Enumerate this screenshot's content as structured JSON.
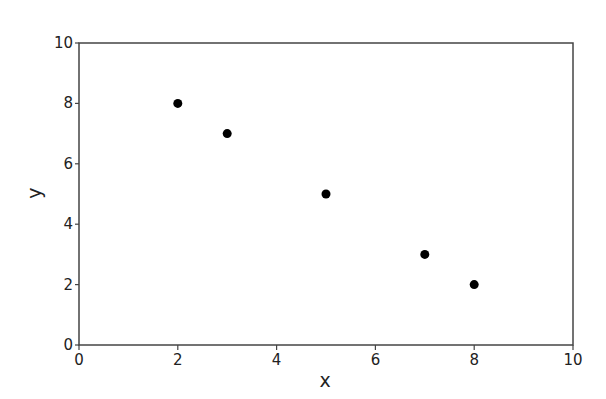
{
  "chart_data": {
    "type": "scatter",
    "title": "",
    "xlabel": "x",
    "ylabel": "y",
    "xlim": [
      0,
      10
    ],
    "ylim": [
      0,
      10
    ],
    "xticks": [
      0,
      2,
      4,
      6,
      8,
      10
    ],
    "yticks": [
      0,
      2,
      4,
      6,
      8,
      10
    ],
    "grid": false,
    "legend": null,
    "series": [
      {
        "name": "points",
        "color": "#000000",
        "points": [
          {
            "x": 2,
            "y": 8
          },
          {
            "x": 3,
            "y": 7
          },
          {
            "x": 5,
            "y": 5
          },
          {
            "x": 7,
            "y": 3
          },
          {
            "x": 8,
            "y": 2
          }
        ]
      }
    ]
  },
  "colors": {
    "axis": "#444444",
    "marker": "#000000",
    "text": "#222222",
    "background": "#ffffff"
  }
}
